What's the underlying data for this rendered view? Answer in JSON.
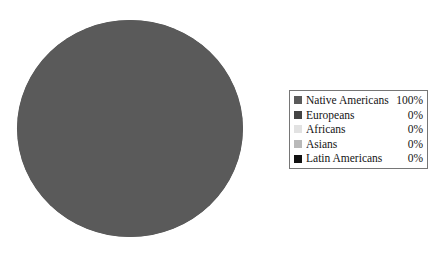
{
  "chart_data": {
    "type": "pie",
    "title": "",
    "subtitle": "",
    "xlabel": "",
    "ylabel": "",
    "grid": false,
    "legend_position": "right",
    "categories": [
      "Native Americans",
      "Europeans",
      "Africans",
      "Asians",
      "Latin Americans"
    ],
    "values": [
      100,
      0,
      0,
      0,
      0
    ],
    "value_labels": [
      "100%",
      "0%",
      "0%",
      "0%",
      "0%"
    ],
    "units": "percent",
    "total": 100,
    "colors": [
      "#5a5a5a",
      "#444444",
      "#e2e2e2",
      "#b9b9b9",
      "#111111"
    ],
    "slices": [
      {
        "label": "Native Americans",
        "value": 100,
        "display": "100%",
        "color": "#5a5a5a",
        "start_angle": 0,
        "end_angle": 360
      },
      {
        "label": "Europeans",
        "value": 0,
        "display": "0%",
        "color": "#444444",
        "start_angle": 360,
        "end_angle": 360
      },
      {
        "label": "Africans",
        "value": 0,
        "display": "0%",
        "color": "#e2e2e2",
        "start_angle": 360,
        "end_angle": 360
      },
      {
        "label": "Asians",
        "value": 0,
        "display": "0%",
        "color": "#b9b9b9",
        "start_angle": 360,
        "end_angle": 360
      },
      {
        "label": "Latin Americans",
        "value": 0,
        "display": "0%",
        "color": "#111111",
        "start_angle": 360,
        "end_angle": 360
      }
    ]
  },
  "legend": {
    "border_color": "#767676",
    "background": "#ffffff",
    "rows": [
      {
        "label": "Native Americans",
        "value": "100%",
        "swatch": "#5a5a5a",
        "swatch_name": "legend-swatch-native-americans"
      },
      {
        "label": "Europeans",
        "value": "0%",
        "swatch": "#444444",
        "swatch_name": "legend-swatch-europeans"
      },
      {
        "label": "Africans",
        "value": "0%",
        "swatch": "#e2e2e2",
        "swatch_name": "legend-swatch-africans"
      },
      {
        "label": "Asians",
        "value": "0%",
        "swatch": "#b9b9b9",
        "swatch_name": "legend-swatch-asians"
      },
      {
        "label": "Latin Americans",
        "value": "0%",
        "swatch": "#111111",
        "swatch_name": "legend-swatch-latin-americans"
      }
    ]
  },
  "canvas": {
    "background": "#ffffff"
  }
}
